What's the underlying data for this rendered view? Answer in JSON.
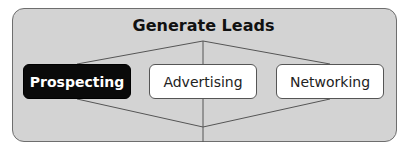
{
  "diagram": {
    "title": "Generate Leads",
    "nodes": [
      {
        "label": "Prospecting",
        "highlighted": true
      },
      {
        "label": "Advertising",
        "highlighted": false
      },
      {
        "label": "Networking",
        "highlighted": false
      }
    ],
    "colors": {
      "frame_fill": "#d3d3d3",
      "highlight_fill": "#0a0a0a",
      "node_fill": "#ffffff",
      "line": "#555555"
    }
  }
}
